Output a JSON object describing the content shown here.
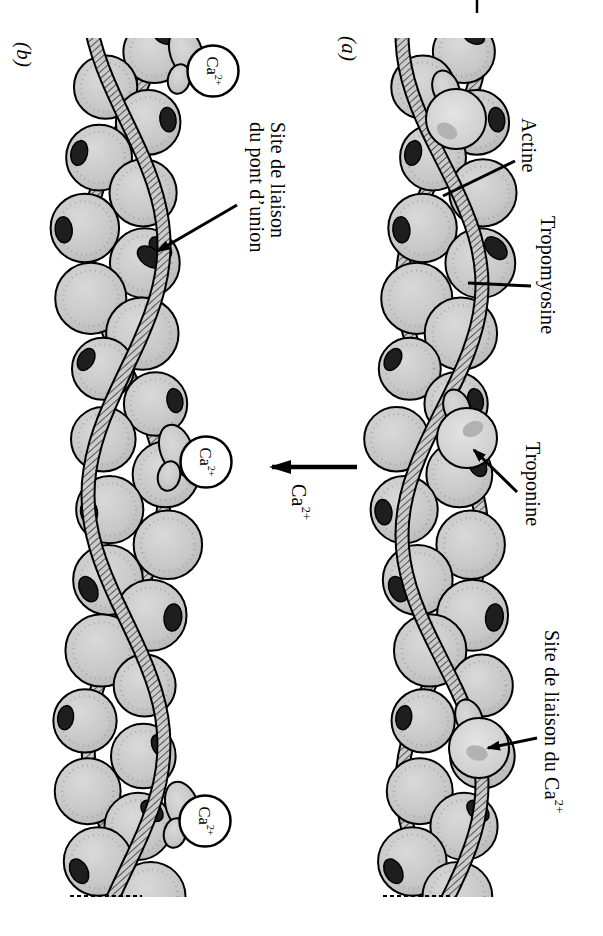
{
  "figure": {
    "panel_a_tag": "(a)",
    "panel_b_tag": "(b)"
  },
  "labels": {
    "actine": "Actine",
    "tropomyosine": "Tropomyosine",
    "troponine": "Troponine",
    "site_ca": {
      "prefix": "Site de liaison du Ca",
      "sup": "2+"
    },
    "site_pont": {
      "line1": "Site de liaison",
      "line2": "du pont d’union"
    },
    "arrow_ion": {
      "base": "Ca",
      "sup": "2+"
    }
  },
  "ion": {
    "base": "Ca",
    "sup": "2+"
  },
  "colors": {
    "background": "#ffffff",
    "ink": "#000000",
    "bead_fill": "#c7c7c7",
    "bead_light": "#dedede",
    "site_dark": "#1e1e1e",
    "spot_gray": "#b2b2b2",
    "ribbon_fill": "#cbcbcb",
    "hatch": "#3d3d3d",
    "ion_circle": "#ffffff"
  }
}
